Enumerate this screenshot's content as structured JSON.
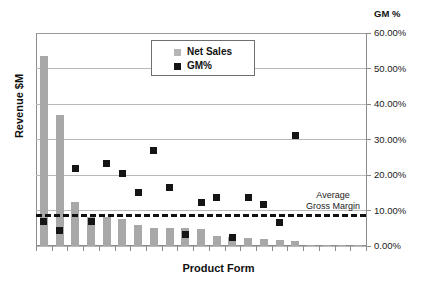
{
  "chart_data": {
    "type": "bar",
    "title": "",
    "xlabel": "Product Form",
    "ylabel": "Revenue $M",
    "secondary_axis_title": "GM %",
    "grid": true,
    "legend_position": "top-center",
    "y2lim": [
      0,
      0.6
    ],
    "y2_ticklabels": [
      "60.00%",
      "50.00%",
      "40.00%",
      "30.00%",
      "20.00%",
      "10.00%",
      "0.00%"
    ],
    "y2_tickvalues": [
      60,
      50,
      40,
      30,
      20,
      10,
      0
    ],
    "categories": [
      "1",
      "2",
      "3",
      "4",
      "5",
      "6",
      "7",
      "8",
      "9",
      "10",
      "11",
      "12",
      "13",
      "14",
      "15",
      "16",
      "17",
      "18",
      "19",
      "20",
      "21"
    ],
    "series": [
      {
        "name": "Net Sales",
        "type": "bar",
        "color": "#a8a8a8",
        "axis": "left",
        "values": [
          56.5,
          39.0,
          13.0,
          8.5,
          8.5,
          8.0,
          6.2,
          5.4,
          5.3,
          5.4,
          5.0,
          3.0,
          2.7,
          2.3,
          2.1,
          1.9,
          1.6,
          0.4,
          0.2,
          0.1,
          0.1
        ]
      },
      {
        "name": "GM%",
        "type": "scatter",
        "color": "#151515",
        "axis": "right",
        "values": [
          6.8,
          4.3,
          21.8,
          7.0,
          23.3,
          20.5,
          15.0,
          16.5,
          3.2,
          12.3,
          13.6,
          2.3,
          13.7,
          11.8,
          6.5,
          26.8,
          31.0,
          null,
          null,
          null,
          null
        ],
        "plotted_points": [
          {
            "x": 1,
            "y": 6.8
          },
          {
            "x": 2,
            "y": 4.3
          },
          {
            "x": 3,
            "y": 21.8
          },
          {
            "x": 4,
            "y": 7.0
          },
          {
            "x": 5,
            "y": 23.3
          },
          {
            "x": 6,
            "y": 20.5
          },
          {
            "x": 7,
            "y": 15.0
          },
          {
            "x": 8,
            "y": 26.8
          },
          {
            "x": 9,
            "y": 16.5
          },
          {
            "x": 10,
            "y": 3.2
          },
          {
            "x": 11,
            "y": 12.3
          },
          {
            "x": 12,
            "y": 13.6
          },
          {
            "x": 13,
            "y": 2.3
          },
          {
            "x": 14,
            "y": 13.7
          },
          {
            "x": 15,
            "y": 11.8
          },
          {
            "x": 16,
            "y": 6.5
          },
          {
            "x": 17,
            "y": 31.0
          }
        ]
      }
    ],
    "annotations": [
      {
        "name": "average-gross-margin",
        "label_line1": "Average",
        "label_line2": "Gross Margin",
        "type": "hline",
        "value": 9.0,
        "style": "dashed",
        "color": "#111111"
      }
    ]
  },
  "legend": {
    "items": [
      {
        "label": "Net Sales",
        "color": "#b5b5b5",
        "marker": "square"
      },
      {
        "label": "GM%",
        "color": "#151515",
        "marker": "square"
      }
    ]
  },
  "axes": {
    "y_left_title": "Revenue $M",
    "x_title": "Product Form",
    "y_right_title": "GM %",
    "y_right_ticks": [
      "60.00%",
      "50.00%",
      "40.00%",
      "30.00%",
      "20.00%",
      "10.00%",
      "0.00%"
    ]
  },
  "annotation": {
    "avg_line_1": "Average",
    "avg_line_2": "Gross Margin"
  },
  "colors": {
    "bar": "#a8a8a8",
    "marker": "#151515",
    "grid": "#b9b9b9",
    "axis": "#8c8c8c",
    "avg_line": "#111111",
    "background": "#ffffff"
  }
}
